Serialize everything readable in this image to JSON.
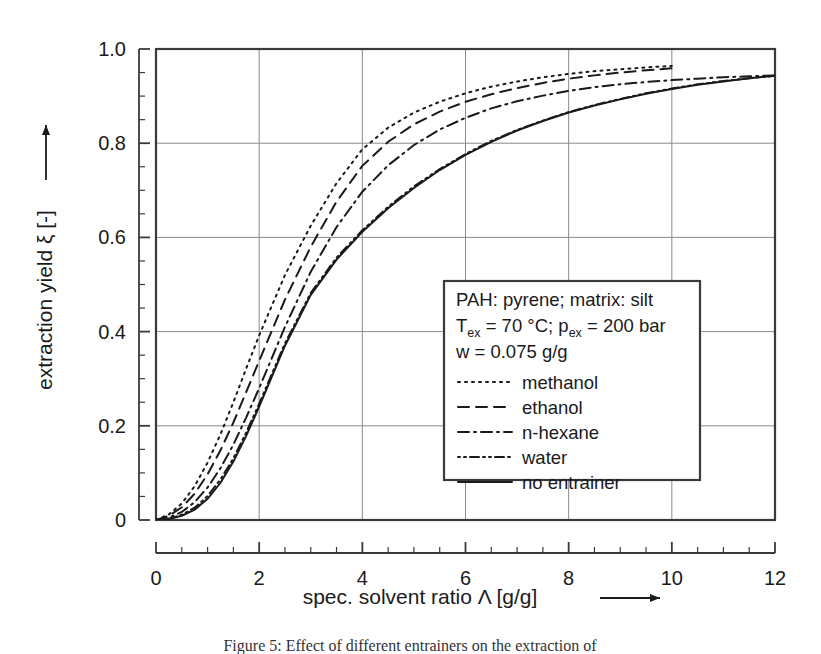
{
  "figure": {
    "background_color": "#ffffff",
    "frame_color": "#3a3a3a",
    "grid_color": "#8a8a8a",
    "curve_color": "#1a1a1a",
    "caption": "Figure 5: Effect of different entrainers on the extraction of"
  },
  "chart_data": {
    "type": "line",
    "title": "",
    "xlabel": "spec. solvent ratio Λ [g/g]",
    "ylabel": "extraction yield ξ [-]",
    "xlim": [
      0,
      12
    ],
    "ylim": [
      0,
      1.0
    ],
    "xticks": [
      0,
      2,
      4,
      6,
      8,
      10,
      12
    ],
    "xtick_labels": [
      "0",
      "2",
      "4",
      "6",
      "8",
      "10",
      "12"
    ],
    "yticks": [
      0,
      0.2,
      0.4,
      0.6,
      0.8,
      1.0
    ],
    "ytick_labels": [
      "0",
      "0.2",
      "0.4",
      "0.6",
      "0.8",
      "1.0"
    ],
    "x_minor_step": 0.5,
    "y_minor_step": 0.05,
    "grid": true,
    "grid_axes": "both",
    "legend_position": "inside-lower-right",
    "series": [
      {
        "name": "methanol",
        "dash": "dotted",
        "dasharray": "2,5",
        "width": 2.0,
        "x": [
          0,
          0.25,
          0.5,
          0.75,
          1.0,
          1.25,
          1.5,
          1.75,
          2.0,
          2.5,
          3.0,
          3.5,
          4.0,
          4.5,
          5.0,
          5.5,
          6.0,
          6.5,
          7.0,
          7.5,
          8.0,
          8.5,
          9.0,
          9.5,
          10.0
        ],
        "y": [
          0,
          0.012,
          0.035,
          0.072,
          0.122,
          0.182,
          0.25,
          0.322,
          0.392,
          0.52,
          0.625,
          0.715,
          0.787,
          0.833,
          0.865,
          0.888,
          0.906,
          0.92,
          0.931,
          0.94,
          0.947,
          0.953,
          0.957,
          0.961,
          0.964
        ]
      },
      {
        "name": "ethanol",
        "dash": "dashed",
        "dasharray": "11,7",
        "width": 2.0,
        "x": [
          0,
          0.25,
          0.5,
          0.75,
          1.0,
          1.25,
          1.5,
          1.75,
          2.0,
          2.5,
          3.0,
          3.5,
          4.0,
          4.5,
          5.0,
          5.5,
          6.0,
          6.5,
          7.0,
          7.5,
          8.0,
          8.5,
          9.0,
          9.5,
          10.0
        ],
        "y": [
          0,
          0.009,
          0.027,
          0.056,
          0.097,
          0.148,
          0.207,
          0.272,
          0.338,
          0.468,
          0.58,
          0.676,
          0.752,
          0.803,
          0.84,
          0.867,
          0.888,
          0.904,
          0.917,
          0.928,
          0.937,
          0.944,
          0.95,
          0.955,
          0.959
        ]
      },
      {
        "name": "n-hexane",
        "dash": "dash-dot",
        "dasharray": "11,5,2,5",
        "width": 2.0,
        "x": [
          0,
          0.25,
          0.5,
          0.75,
          1.0,
          1.25,
          1.5,
          1.75,
          2.0,
          2.5,
          3.0,
          3.5,
          4.0,
          4.5,
          5.0,
          5.5,
          6.0,
          6.5,
          7.0,
          7.5,
          8.0,
          8.5,
          9.0,
          9.5,
          10.0,
          10.5,
          11.0,
          11.5,
          12.0
        ],
        "y": [
          0,
          0.005,
          0.017,
          0.038,
          0.069,
          0.11,
          0.16,
          0.218,
          0.28,
          0.41,
          0.527,
          0.622,
          0.697,
          0.753,
          0.796,
          0.829,
          0.854,
          0.874,
          0.889,
          0.901,
          0.911,
          0.919,
          0.925,
          0.93,
          0.934,
          0.937,
          0.94,
          0.942,
          0.944
        ]
      },
      {
        "name": "water",
        "dash": "dot-dot-dash",
        "dasharray": "2,4,2,4,9,4",
        "width": 2.0,
        "x": [
          0,
          0.25,
          0.5,
          0.75,
          1.0,
          1.25,
          1.5,
          1.75,
          2.0,
          2.5,
          3.0,
          3.5,
          4.0,
          4.5,
          5.0,
          5.5,
          6.0,
          6.5,
          7.0,
          7.5,
          8.0,
          8.5,
          9.0,
          9.5,
          10.0,
          10.5,
          11.0,
          11.5,
          12.0
        ],
        "y": [
          0,
          0.003,
          0.011,
          0.026,
          0.051,
          0.086,
          0.131,
          0.186,
          0.247,
          0.375,
          0.482,
          0.557,
          0.615,
          0.665,
          0.708,
          0.745,
          0.777,
          0.805,
          0.828,
          0.848,
          0.866,
          0.881,
          0.894,
          0.906,
          0.916,
          0.925,
          0.932,
          0.938,
          0.943
        ]
      },
      {
        "name": "no entrainer",
        "dash": "solid",
        "dasharray": "",
        "width": 2.0,
        "x": [
          0,
          0.25,
          0.5,
          0.75,
          1.0,
          1.25,
          1.5,
          1.75,
          2.0,
          2.5,
          3.0,
          3.5,
          4.0,
          4.5,
          5.0,
          5.5,
          6.0,
          6.5,
          7.0,
          7.5,
          8.0,
          8.5,
          9.0,
          9.5,
          10.0,
          10.5,
          11.0,
          11.5,
          12.0
        ],
        "y": [
          0,
          0.002,
          0.009,
          0.022,
          0.045,
          0.079,
          0.124,
          0.179,
          0.241,
          0.37,
          0.478,
          0.553,
          0.612,
          0.662,
          0.705,
          0.743,
          0.775,
          0.803,
          0.827,
          0.847,
          0.865,
          0.88,
          0.893,
          0.905,
          0.915,
          0.924,
          0.931,
          0.938,
          0.943
        ]
      }
    ]
  },
  "legend": {
    "line1": "PAH: pyrene; matrix: silt",
    "line2_a": "T",
    "line2_sub_a": "ex",
    "line2_b": " = 70 °C; p",
    "line2_sub_b": "ex",
    "line2_c": " = 200 bar",
    "line3": "w = 0.075 g/g",
    "entries": [
      {
        "label": "methanol"
      },
      {
        "label": "ethanol"
      },
      {
        "label": "n-hexane"
      },
      {
        "label": "water"
      },
      {
        "label": "no entrainer"
      }
    ]
  },
  "axis_arrows": {
    "x_arrow": "right-arrow-icon",
    "y_arrow": "up-arrow-icon"
  }
}
